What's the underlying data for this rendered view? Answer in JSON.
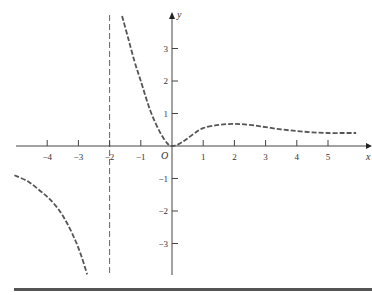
{
  "chart_data": {
    "type": "line",
    "title": "",
    "xlabel": "x",
    "ylabel": "y",
    "origin_label": "O",
    "xlim": [
      -5.2,
      6.0
    ],
    "ylim": [
      -4.0,
      4.1
    ],
    "grid": false,
    "x_ticks": [
      -4,
      -3,
      -2,
      -1,
      1,
      2,
      3,
      4,
      5
    ],
    "x_tick_labels": [
      "−4",
      "−3",
      "−2",
      "−1",
      "1",
      "2",
      "3",
      "4",
      "5"
    ],
    "y_ticks": [
      3,
      2,
      1,
      -1,
      -2,
      -3
    ],
    "y_tick_labels": [
      "3",
      "2",
      "1",
      "−1",
      "−2",
      "−3"
    ],
    "annotations": [
      {
        "type": "vertical_asymptote",
        "x": -2,
        "style": "dashed"
      }
    ],
    "series": [
      {
        "name": "left-branch",
        "style": "dashed",
        "points": [
          [
            -5.05,
            -0.9
          ],
          [
            -4.6,
            -1.1
          ],
          [
            -4.2,
            -1.4
          ],
          [
            -3.9,
            -1.65
          ],
          [
            -3.6,
            -2.0
          ],
          [
            -3.35,
            -2.4
          ],
          [
            -3.1,
            -2.9
          ],
          [
            -2.9,
            -3.4
          ],
          [
            -2.72,
            -3.95
          ]
        ]
      },
      {
        "name": "right-branch",
        "style": "dashed",
        "points": [
          [
            -1.6,
            4.0
          ],
          [
            -1.4,
            3.3
          ],
          [
            -1.2,
            2.6
          ],
          [
            -1.0,
            2.0
          ],
          [
            -0.7,
            1.1
          ],
          [
            -0.4,
            0.45
          ],
          [
            -0.15,
            0.08
          ],
          [
            0,
            0
          ],
          [
            0.2,
            0.05
          ],
          [
            0.45,
            0.2
          ],
          [
            0.7,
            0.38
          ],
          [
            1.0,
            0.55
          ],
          [
            1.5,
            0.65
          ],
          [
            2.0,
            0.68
          ],
          [
            2.5,
            0.65
          ],
          [
            3.0,
            0.58
          ],
          [
            3.5,
            0.51
          ],
          [
            4.0,
            0.46
          ],
          [
            4.5,
            0.42
          ],
          [
            5.0,
            0.4
          ],
          [
            5.5,
            0.4
          ],
          [
            5.9,
            0.4
          ]
        ]
      }
    ]
  },
  "frame": {
    "origin_px": [
      172,
      146
    ],
    "unit_x_px": 31.2,
    "unit_y_px": 32.5
  }
}
